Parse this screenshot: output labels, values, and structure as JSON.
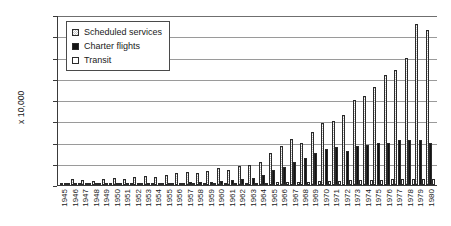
{
  "chart_data": {
    "type": "bar",
    "title": "",
    "xlabel": "",
    "ylabel": "x 10,000",
    "ylim": [
      0,
      800
    ],
    "ytick_step": 100,
    "yticks": [
      0,
      100,
      200,
      300,
      400,
      500,
      600,
      700,
      800
    ],
    "grid": true,
    "legend_position": "top-left",
    "categories": [
      "1945",
      "1946",
      "1947",
      "1948",
      "1949",
      "1950",
      "1951",
      "1952",
      "1953",
      "1954",
      "1955",
      "1956",
      "1957",
      "1958",
      "1959",
      "1960",
      "1961",
      "1962",
      "1963",
      "1964",
      "1965",
      "1966",
      "1967",
      "1968",
      "1969",
      "1970",
      "1971",
      "1972",
      "1973",
      "1974",
      "1975",
      "1976",
      "1977",
      "1978",
      "1979",
      "1980"
    ],
    "series": [
      {
        "name": "Scheduled services",
        "fill": "hatched",
        "values": [
          8,
          28,
          22,
          18,
          26,
          32,
          30,
          38,
          42,
          38,
          46,
          58,
          62,
          56,
          68,
          80,
          72,
          88,
          96,
          110,
          150,
          182,
          218,
          196,
          248,
          290,
          300,
          330,
          400,
          420,
          460,
          520,
          540,
          600,
          760,
          730
        ]
      },
      {
        "name": "Charter flights",
        "fill": "solid-black",
        "values": [
          1,
          2,
          2,
          3,
          4,
          5,
          5,
          6,
          7,
          8,
          9,
          11,
          12,
          13,
          16,
          20,
          22,
          26,
          34,
          48,
          70,
          86,
          110,
          128,
          150,
          170,
          178,
          160,
          182,
          190,
          196,
          200,
          210,
          214,
          212,
          196
        ]
      },
      {
        "name": "Transit",
        "fill": "white",
        "values": [
          1,
          2,
          2,
          2,
          3,
          3,
          3,
          4,
          4,
          4,
          5,
          6,
          6,
          6,
          7,
          8,
          8,
          9,
          10,
          11,
          13,
          14,
          16,
          16,
          18,
          20,
          21,
          22,
          24,
          24,
          25,
          26,
          27,
          28,
          30,
          28
        ]
      }
    ]
  },
  "legend": {
    "items": [
      {
        "label": "Scheduled services"
      },
      {
        "label": "Charter flights"
      },
      {
        "label": "Transit"
      }
    ]
  }
}
